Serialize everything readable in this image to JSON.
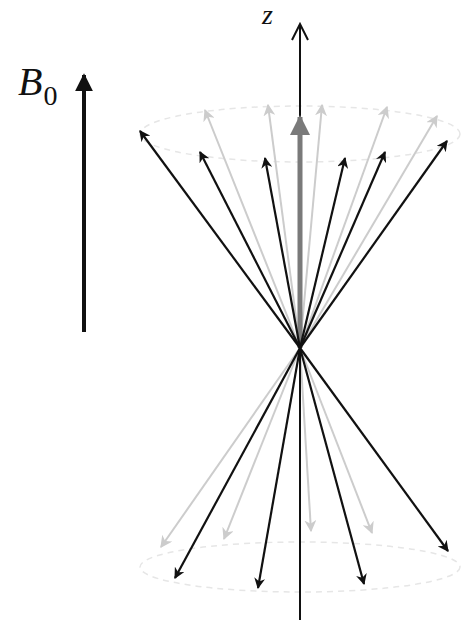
{
  "labels": {
    "field": "B",
    "field_subscript": "0",
    "axis": "z"
  },
  "colors": {
    "black_arrow": "#111111",
    "light_arrow": "#cccccc",
    "net_magnetization": "#7a7a7a",
    "cone_outline": "#e6e6e6"
  },
  "geometry": {
    "origin": [
      300,
      348
    ],
    "z_axis": {
      "top": [
        300,
        24
      ],
      "bottom": [
        300,
        620
      ]
    },
    "b0_arrow": {
      "tail": [
        84,
        332
      ],
      "tip": [
        84,
        75
      ]
    },
    "net_magnetization_tip": [
      300,
      117
    ],
    "upper_cone_ellipse": {
      "cx": 300,
      "cy": 134,
      "rx": 160,
      "ry": 28
    },
    "lower_cone_ellipse": {
      "cx": 300,
      "cy": 567,
      "rx": 160,
      "ry": 25
    },
    "upper_black_tips": [
      [
        140,
        131
      ],
      [
        200,
        152
      ],
      [
        265,
        158
      ],
      [
        345,
        158
      ],
      [
        385,
        152
      ],
      [
        447,
        141
      ]
    ],
    "upper_light_tips": [
      [
        205,
        110
      ],
      [
        268,
        105
      ],
      [
        322,
        105
      ],
      [
        387,
        107
      ],
      [
        437,
        116
      ]
    ],
    "lower_black_tips": [
      [
        175,
        578
      ],
      [
        258,
        588
      ],
      [
        364,
        584
      ],
      [
        448,
        551
      ]
    ],
    "lower_light_tips": [
      [
        161,
        547
      ],
      [
        224,
        539
      ],
      [
        311,
        531
      ],
      [
        372,
        533
      ]
    ]
  }
}
